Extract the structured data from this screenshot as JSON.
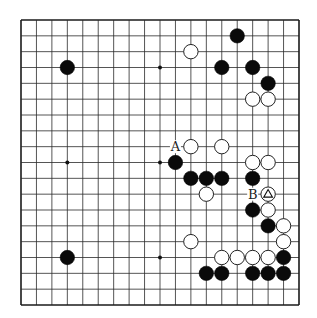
{
  "board": {
    "size": 19,
    "origin": {
      "x": 21,
      "y": 20
    },
    "extent": {
      "x": 299,
      "y": 305
    },
    "line_color": "#2a2a2a",
    "border_color": "#1a1a1a",
    "hoshi": [
      [
        3,
        3
      ],
      [
        9,
        3
      ],
      [
        15,
        3
      ],
      [
        3,
        9
      ],
      [
        9,
        9
      ],
      [
        15,
        9
      ],
      [
        3,
        15
      ],
      [
        9,
        15
      ],
      [
        15,
        15
      ]
    ],
    "visible_hoshi": [
      [
        9,
        3
      ],
      [
        3,
        9
      ],
      [
        9,
        9
      ],
      [
        9,
        15
      ]
    ]
  },
  "stones": {
    "black": [
      [
        3,
        3
      ],
      [
        14,
        1
      ],
      [
        13,
        3
      ],
      [
        15,
        3
      ],
      [
        16,
        4
      ],
      [
        10,
        9
      ],
      [
        11,
        10
      ],
      [
        12,
        10
      ],
      [
        13,
        10
      ],
      [
        15,
        10
      ],
      [
        15,
        12
      ],
      [
        16,
        13
      ],
      [
        17,
        15
      ],
      [
        12,
        16
      ],
      [
        13,
        16
      ],
      [
        15,
        16
      ],
      [
        16,
        16
      ],
      [
        17,
        16
      ],
      [
        3,
        15
      ]
    ],
    "white": [
      [
        11,
        2
      ],
      [
        15,
        5
      ],
      [
        16,
        5
      ],
      [
        11,
        8
      ],
      [
        13,
        8
      ],
      [
        15,
        9
      ],
      [
        16,
        9
      ],
      [
        12,
        11
      ],
      [
        16,
        11
      ],
      [
        16,
        12
      ],
      [
        17,
        13
      ],
      [
        11,
        14
      ],
      [
        17,
        14
      ],
      [
        13,
        15
      ],
      [
        14,
        15
      ],
      [
        15,
        15
      ],
      [
        16,
        15
      ]
    ]
  },
  "markers": [
    {
      "type": "triangle",
      "col": 16,
      "row": 11,
      "on": "white"
    }
  ],
  "labels": [
    {
      "text": "A",
      "col": 10,
      "row": 8
    },
    {
      "text": "B",
      "col": 15,
      "row": 11
    }
  ]
}
